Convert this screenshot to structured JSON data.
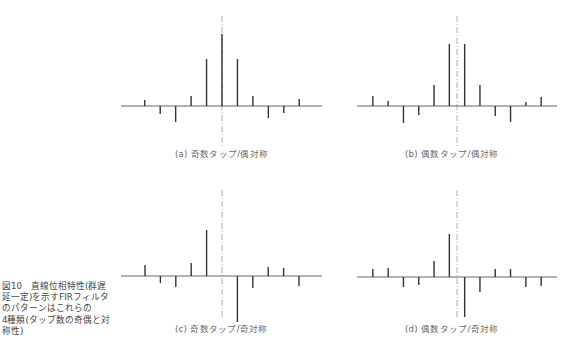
{
  "side_caption": {
    "figure_number": "図10",
    "lines": [
      "図10　直線位相特性(群遅",
      "延一定)を示すFIRフィルタ",
      "のパターンはこれらの",
      "4種類(タップ数の奇偶と対",
      "称性)"
    ],
    "text": "図10 直線位相特性(群遅延一定)を示すFIRフィルタのパターンはこれらの4種類(タップ数の奇偶と対称性)"
  },
  "panels": [
    {
      "id": "a",
      "caption": "(a) 奇数タップ/偶対称"
    },
    {
      "id": "b",
      "caption": "(b) 偶数タップ/偶対称"
    },
    {
      "id": "c",
      "caption": "(c) 奇数タップ/奇対称"
    },
    {
      "id": "d",
      "caption": "(d) 偶数タップ/奇対称"
    }
  ],
  "colors": {
    "stem": "#333333",
    "axis": "#555555",
    "center_line": "#999999",
    "caption": "#666666"
  },
  "chart_data": [
    {
      "type": "stem",
      "title": "(a) 奇数タップ/偶対称",
      "taps": 11,
      "symmetry": "even",
      "x": [
        -5,
        -4,
        -3,
        -2,
        -1,
        0,
        1,
        2,
        3,
        4,
        5
      ],
      "values": [
        6,
        -8,
        -16,
        10,
        47,
        72,
        47,
        10,
        -12,
        -7,
        7
      ],
      "center_line": true,
      "grid": false
    },
    {
      "type": "stem",
      "title": "(b) 偶数タップ/偶対称",
      "taps": 12,
      "symmetry": "even",
      "x": [
        -5.5,
        -4.5,
        -3.5,
        -2.5,
        -1.5,
        -0.5,
        0.5,
        1.5,
        2.5,
        3.5,
        4.5,
        5.5
      ],
      "values": [
        10,
        5,
        -17,
        -9,
        21,
        62,
        62,
        21,
        -10,
        -16,
        4,
        9
      ],
      "center_line": true,
      "grid": false
    },
    {
      "type": "stem",
      "title": "(c) 奇数タップ/奇対称",
      "taps": 11,
      "symmetry": "odd",
      "x": [
        -5,
        -4,
        -3,
        -2,
        -1,
        0,
        1,
        2,
        3,
        4,
        5
      ],
      "values": [
        11,
        -7,
        -11,
        13,
        46,
        0,
        -46,
        -12,
        9,
        8,
        -10
      ],
      "center_line": true,
      "grid": false
    },
    {
      "type": "stem",
      "title": "(d) 偶数タップ/奇対称",
      "taps": 12,
      "symmetry": "odd",
      "x": [
        -5.5,
        -4.5,
        -3.5,
        -2.5,
        -1.5,
        -0.5,
        0.5,
        1.5,
        2.5,
        3.5,
        4.5,
        5.5
      ],
      "values": [
        8,
        9,
        -10,
        -8,
        16,
        43,
        -40,
        -15,
        8,
        8,
        -10,
        -9
      ],
      "center_line": true,
      "grid": false
    }
  ]
}
